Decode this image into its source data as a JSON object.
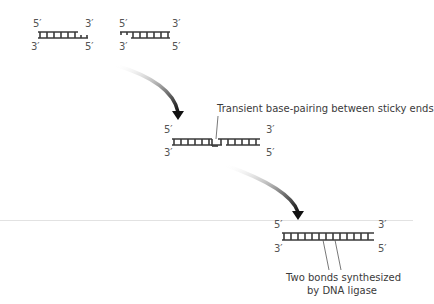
{
  "fragments": {
    "left": {
      "top_left": "5′",
      "top_right": "3′",
      "bottom_left": "3′",
      "bottom_right": "5′"
    },
    "right": {
      "top_left": "5′",
      "top_right": "3′",
      "bottom_left": "3′",
      "bottom_right": "5′"
    }
  },
  "annealed": {
    "top_left": "5′",
    "top_right": "3′",
    "bottom_left": "3′",
    "bottom_right": "5′",
    "caption": "Transient base-pairing between sticky ends"
  },
  "ligated": {
    "top_left": "5′",
    "top_right": "3′",
    "bottom_left": "3′",
    "bottom_right": "5′",
    "caption_line1": "Two bonds synthesized",
    "caption_line2": "by DNA ligase"
  },
  "colors": {
    "strand": "#3a3a3a",
    "arrow": "#222222",
    "label": "#555555"
  }
}
